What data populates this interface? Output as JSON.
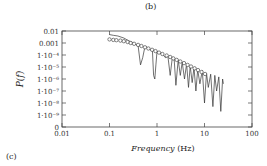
{
  "figure": {
    "top_panel_label": "(b)",
    "bottom_panel_label": "(c)"
  },
  "chart_data": {
    "type": "line",
    "title": "",
    "xlabel": "Frequency (Hz)",
    "xlabel_var": "Frequency",
    "xlabel_unit": "(Hz)",
    "ylabel": "P(f)",
    "xscale": "log",
    "yscale": "log",
    "xlim": [
      0.01,
      100
    ],
    "ylim": [
      0,
      0.01
    ],
    "x_ticks": [
      "0.01",
      "0.1",
      "1",
      "10",
      "100"
    ],
    "y_ticks": [
      "0.01",
      "0.001",
      "1·10⁻⁴",
      "1·10⁻⁵",
      "1·10⁻⁶",
      "1·10⁻⁷",
      "1·10⁻⁸",
      "1·10⁻⁹",
      "0"
    ],
    "grid": false,
    "legend": null,
    "series": [
      {
        "name": "binned spectrum (circles)",
        "marker": "circle",
        "x": [
          0.1,
          0.12,
          0.14,
          0.17,
          0.2,
          0.24,
          0.28,
          0.33,
          0.4,
          0.47,
          0.56,
          0.66,
          0.79,
          0.93,
          1.1,
          1.3,
          1.6,
          1.9,
          2.2,
          2.6,
          3.1,
          3.7,
          4.4,
          5.2,
          6.2,
          7.3,
          8.7,
          10.3
        ],
        "y": [
          0.002,
          0.0018,
          0.0017,
          0.0016,
          0.0014,
          0.0012,
          0.001,
          0.00085,
          0.0007,
          0.00056,
          0.00044,
          0.00035,
          0.00027,
          0.00021,
          0.00016,
          0.00012,
          9e-05,
          6.8e-05,
          5.2e-05,
          3.9e-05,
          2.9e-05,
          2.1e-05,
          1.5e-05,
          1.1e-05,
          7.8e-06,
          5.5e-06,
          3.8e-06,
          2.6e-06
        ]
      },
      {
        "name": "raw spectrum (line)",
        "marker": "none",
        "x": [
          0.1,
          0.12,
          0.15,
          0.2,
          0.25,
          0.3,
          0.35,
          0.4,
          0.45,
          0.5,
          0.55,
          0.6,
          0.7,
          0.8,
          0.85,
          0.9,
          0.95,
          1.0,
          1.1,
          1.3,
          1.5,
          1.7,
          1.9,
          2.1,
          2.3,
          2.5,
          2.8,
          3.1,
          3.4,
          3.8,
          4.2,
          4.6,
          5.0,
          5.5,
          6.0,
          6.6,
          7.2,
          8.0,
          9.0,
          10,
          11,
          12,
          13.5,
          15,
          16.5,
          18,
          20,
          22,
          24,
          25
        ],
        "y": [
          0.005,
          0.0044,
          0.0038,
          0.0026,
          0.0016,
          0.0011,
          0.0008,
          0.0006,
          1.5e-05,
          6e-05,
          0.0004,
          0.00045,
          0.0003,
          0.00025,
          2e-06,
          1e-06,
          1.5e-05,
          0.0002,
          0.00015,
          0.00012,
          6e-05,
          8e-05,
          2e-06,
          6e-05,
          4e-05,
          3e-07,
          4e-05,
          2e-06,
          2.5e-05,
          1e-06,
          1.8e-05,
          2e-07,
          1.2e-05,
          5e-07,
          9e-06,
          1e-07,
          6e-06,
          4e-07,
          5e-06,
          1e-08,
          3e-06,
          2e-07,
          2.5e-06,
          5e-09,
          2e-06,
          1e-07,
          1.5e-06,
          2e-09,
          1e-06,
          4e-07
        ]
      }
    ]
  }
}
